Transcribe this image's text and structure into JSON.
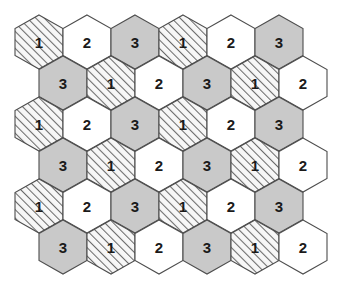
{
  "figure": {
    "background_color": "#ffffff",
    "width": 344,
    "height": 297
  },
  "styles": {
    "fill_white": "#ffffff",
    "fill_gray": "#c9c9c9",
    "fill_hatch_base": "#f7f7f7",
    "hatch_line_color": "#6b6b6b",
    "stroke_color": "#4d4d4d",
    "text_color": "#1a1a1a"
  },
  "geometry": {
    "hex_width": 48,
    "hex_height": 54,
    "row_vertical_step": 41,
    "first_center_x": 39,
    "first_center_y": 42,
    "row_offset_x": 24,
    "columns_per_row": 6,
    "rows": 6
  },
  "legend": {
    "fill_types": [
      {
        "key": "hatch",
        "label": "1",
        "description": "diagonal-hatch"
      },
      {
        "key": "white",
        "label": "2",
        "description": "plain-white"
      },
      {
        "key": "gray",
        "label": "3",
        "description": "solid-gray"
      }
    ]
  },
  "grid": {
    "rows": [
      {
        "index": 0,
        "offset": false,
        "cells": [
          {
            "label": "1",
            "fill": "hatch"
          },
          {
            "label": "2",
            "fill": "white"
          },
          {
            "label": "3",
            "fill": "gray"
          },
          {
            "label": "1",
            "fill": "hatch"
          },
          {
            "label": "2",
            "fill": "white"
          },
          {
            "label": "3",
            "fill": "gray"
          }
        ]
      },
      {
        "index": 1,
        "offset": true,
        "cells": [
          {
            "label": "3",
            "fill": "gray"
          },
          {
            "label": "1",
            "fill": "hatch"
          },
          {
            "label": "2",
            "fill": "white"
          },
          {
            "label": "3",
            "fill": "gray"
          },
          {
            "label": "1",
            "fill": "hatch"
          },
          {
            "label": "2",
            "fill": "white"
          }
        ]
      },
      {
        "index": 2,
        "offset": false,
        "cells": [
          {
            "label": "1",
            "fill": "hatch"
          },
          {
            "label": "2",
            "fill": "white"
          },
          {
            "label": "3",
            "fill": "gray"
          },
          {
            "label": "1",
            "fill": "hatch"
          },
          {
            "label": "2",
            "fill": "white"
          },
          {
            "label": "3",
            "fill": "gray"
          }
        ]
      },
      {
        "index": 3,
        "offset": true,
        "cells": [
          {
            "label": "3",
            "fill": "gray"
          },
          {
            "label": "1",
            "fill": "hatch"
          },
          {
            "label": "2",
            "fill": "white"
          },
          {
            "label": "3",
            "fill": "gray"
          },
          {
            "label": "1",
            "fill": "hatch"
          },
          {
            "label": "2",
            "fill": "white"
          }
        ]
      },
      {
        "index": 4,
        "offset": false,
        "cells": [
          {
            "label": "1",
            "fill": "hatch"
          },
          {
            "label": "2",
            "fill": "white"
          },
          {
            "label": "3",
            "fill": "gray"
          },
          {
            "label": "1",
            "fill": "hatch"
          },
          {
            "label": "2",
            "fill": "white"
          },
          {
            "label": "3",
            "fill": "gray"
          }
        ]
      },
      {
        "index": 5,
        "offset": true,
        "cells": [
          {
            "label": "3",
            "fill": "gray"
          },
          {
            "label": "1",
            "fill": "hatch"
          },
          {
            "label": "2",
            "fill": "white"
          },
          {
            "label": "3",
            "fill": "gray"
          },
          {
            "label": "1",
            "fill": "hatch"
          },
          {
            "label": "2",
            "fill": "white"
          }
        ]
      }
    ]
  }
}
